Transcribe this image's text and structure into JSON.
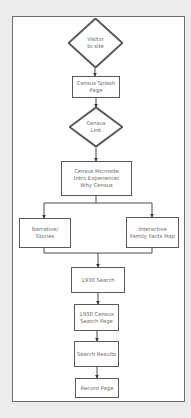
{
  "diagram": {
    "type": "flowchart",
    "nodes": [
      {
        "id": "visitor",
        "shape": "diamond",
        "label": "Visitor\nto site",
        "x": 68,
        "y": 18,
        "w": 55,
        "h": 50
      },
      {
        "id": "splash",
        "shape": "rect",
        "label": "Census Splash\nPage",
        "x": 72,
        "y": 76,
        "w": 48,
        "h": 22
      },
      {
        "id": "census_link",
        "shape": "diamond",
        "label": "Census\nLink",
        "x": 69,
        "y": 107,
        "w": 54,
        "h": 40
      },
      {
        "id": "microsite",
        "shape": "rect",
        "label": "Census Microsite\nIntro Experience/\nWhy Census",
        "x": 61,
        "y": 161,
        "w": 71,
        "h": 35
      },
      {
        "id": "narrative",
        "shape": "rect",
        "label": "Narrative/\nStories",
        "x": 19,
        "y": 218,
        "w": 52,
        "h": 30
      },
      {
        "id": "family_map",
        "shape": "rect",
        "label": "Interactive\nFamily Facts Map",
        "x": 126,
        "y": 217,
        "w": 53,
        "h": 31
      },
      {
        "id": "search_1930",
        "shape": "rect",
        "label": "1930 Search",
        "x": 71,
        "y": 267,
        "w": 54,
        "h": 26
      },
      {
        "id": "census_search_page",
        "shape": "rect",
        "label": "1930 Census\nSearch Page",
        "x": 74,
        "y": 304,
        "w": 45,
        "h": 27
      },
      {
        "id": "search_results",
        "shape": "rect",
        "label": "Search Results",
        "x": 74,
        "y": 341,
        "w": 45,
        "h": 26
      },
      {
        "id": "record_page",
        "shape": "rect",
        "label": "Record Page",
        "x": 75,
        "y": 378,
        "w": 44,
        "h": 20
      }
    ],
    "edges": [
      {
        "from": "visitor",
        "to": "splash",
        "points": [
          [
            95,
            68
          ],
          [
            95,
            76
          ]
        ]
      },
      {
        "from": "splash",
        "to": "census_link",
        "points": [
          [
            96,
            98
          ],
          [
            96,
            107
          ]
        ]
      },
      {
        "from": "census_link",
        "to": "microsite",
        "points": [
          [
            96,
            147
          ],
          [
            96,
            161
          ]
        ]
      },
      {
        "from": "microsite",
        "to": "narrative",
        "points": [
          [
            96,
            196
          ],
          [
            96,
            203
          ],
          [
            44,
            203
          ],
          [
            44,
            218
          ]
        ]
      },
      {
        "from": "microsite",
        "to": "family_map",
        "points": [
          [
            96,
            203
          ],
          [
            152,
            203
          ],
          [
            152,
            217
          ]
        ]
      },
      {
        "from": "narrative",
        "to": "search_1930",
        "points": [
          [
            44,
            248
          ],
          [
            44,
            253
          ],
          [
            98,
            253
          ],
          [
            98,
            267
          ]
        ]
      },
      {
        "from": "family_map",
        "to": "search_1930",
        "points": [
          [
            152,
            248
          ],
          [
            152,
            253
          ],
          [
            98,
            253
          ]
        ]
      },
      {
        "from": "search_1930",
        "to": "census_search_page",
        "points": [
          [
            98,
            293
          ],
          [
            98,
            304
          ]
        ]
      },
      {
        "from": "census_search_page",
        "to": "search_results",
        "points": [
          [
            97,
            331
          ],
          [
            97,
            341
          ]
        ]
      },
      {
        "from": "search_results",
        "to": "record_page",
        "points": [
          [
            97,
            367
          ],
          [
            97,
            378
          ]
        ]
      }
    ],
    "colors": {
      "background": "#ececec",
      "frame_fill": "#ffffff",
      "frame_border": "#6e6e6e",
      "node_border": "#5a5a5a",
      "line": "#4a4a4a",
      "text": "#6a6a6a"
    }
  }
}
